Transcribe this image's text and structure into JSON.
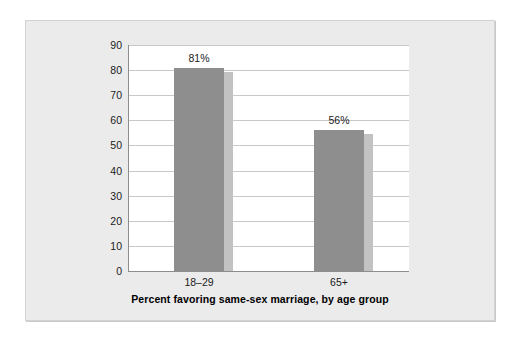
{
  "chart_data": {
    "type": "bar",
    "title": "",
    "subtitle": "",
    "xlabel": "Percent favoring same-sex marriage, by age group",
    "ylabel": "",
    "categories": [
      "18–29",
      "65+"
    ],
    "values": [
      81,
      56
    ],
    "data_labels": [
      "81%",
      "56%"
    ],
    "ylim": [
      0,
      90
    ],
    "y_ticks": [
      90,
      80,
      70,
      60,
      50,
      40,
      30,
      20,
      10,
      0
    ],
    "y_tick_labels": [
      "90",
      "80",
      "70",
      "60",
      "50",
      "40",
      "30",
      "20",
      "10",
      "0"
    ],
    "grid": true,
    "grid_axis": "y",
    "legend": false,
    "legend_position": "none",
    "series": [
      {
        "name": "Percent favoring same-sex marriage",
        "values": [
          81,
          56
        ]
      }
    ]
  },
  "colors": {
    "bar_fill": "#8e8e8e",
    "bar_shadow": "#c2c2c2",
    "panel_background": "#ebebec",
    "plot_background": "#ffffff",
    "gridline": "#c8c8c8",
    "axis_line": "#8d8d8d",
    "text": "#1b1b1b",
    "title_text": "#000000",
    "page_background": "#ffffff"
  }
}
